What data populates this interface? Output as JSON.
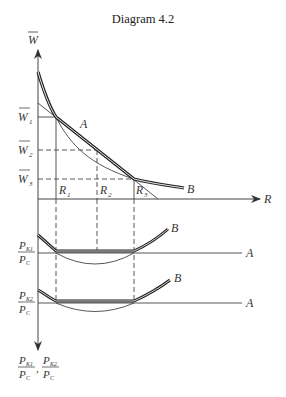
{
  "title": "Diagram 4.2",
  "top_panel": {
    "y_axis_label": "W",
    "x_axis_label": "R",
    "y_ticks": [
      {
        "label": "W",
        "sub": "1"
      },
      {
        "label": "W",
        "sub": "2"
      },
      {
        "label": "W",
        "sub": "3"
      }
    ],
    "x_ticks": [
      {
        "label": "R",
        "sub": "1"
      },
      {
        "label": "R",
        "sub": "2"
      },
      {
        "label": "R",
        "sub": "3"
      }
    ],
    "curve_labels": {
      "a": "A",
      "b": "B"
    }
  },
  "middle_panel": {
    "y_label_num": "P",
    "y_label_num_sub": "K1",
    "y_label_den": "P",
    "y_label_den_sub": "C",
    "curve_labels": {
      "a": "A",
      "b": "B"
    }
  },
  "bottom_panel": {
    "y_label_num": "P",
    "y_label_num_sub": "K2",
    "y_label_den": "P",
    "y_label_den_sub": "C",
    "curve_labels": {
      "a": "A",
      "b": "B"
    }
  },
  "bottom_axis_label": {
    "first_num": "P",
    "first_num_sub": "K1",
    "second_num": "P",
    "second_num_sub": "K2",
    "den": "P",
    "den_sub": "C",
    "separator": ","
  },
  "colors": {
    "ink": "#333333",
    "background": "#ffffff"
  }
}
